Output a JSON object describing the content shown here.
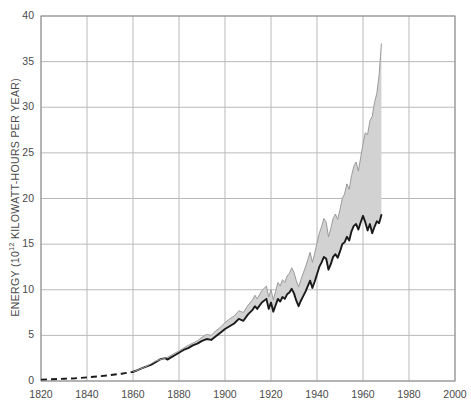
{
  "chart_data": {
    "type": "area",
    "title": "",
    "xlabel": "",
    "ylabel": "ENERGY (10¹² KILOWATT-HOURS PER YEAR)",
    "ylabel_prefix": "ENERGY (10",
    "ylabel_exponent": "12",
    "ylabel_suffix": " KILOWATT-HOURS PER YEAR)",
    "xlim": [
      1820,
      2000
    ],
    "ylim": [
      0,
      40
    ],
    "xticks": [
      1820,
      1840,
      1860,
      1880,
      1900,
      1920,
      1940,
      1960,
      1980,
      2000
    ],
    "yticks": [
      0,
      5,
      10,
      15,
      20,
      25,
      30,
      35,
      40
    ],
    "xtick_labels": [
      "1820",
      "1840",
      "1860",
      "1880",
      "1900",
      "1920",
      "1940",
      "1960",
      "1980",
      "2000"
    ],
    "ytick_labels": [
      "0",
      "5",
      "10",
      "15",
      "20",
      "25",
      "30",
      "35",
      "40"
    ],
    "grid": true,
    "legend": "none",
    "colors": {
      "band_fill": "#d2d2d2",
      "line": "#1a1a1a",
      "grid": "#b9b9b9",
      "axis": "#8c8c8c",
      "text": "#4a4a4a",
      "background": "#ffffff"
    },
    "series": [
      {
        "name": "lower-bound-energy",
        "style": "solid-line-with-dashed-extrapolation",
        "dashed_until_year": 1860,
        "x": [
          1820,
          1825,
          1830,
          1835,
          1840,
          1845,
          1850,
          1855,
          1860,
          1862,
          1864,
          1866,
          1868,
          1870,
          1872,
          1874,
          1875,
          1876,
          1878,
          1880,
          1882,
          1884,
          1886,
          1888,
          1890,
          1892,
          1894,
          1896,
          1898,
          1900,
          1902,
          1904,
          1906,
          1908,
          1910,
          1912,
          1913,
          1914,
          1916,
          1918,
          1919,
          1920,
          1921,
          1922,
          1923,
          1924,
          1925,
          1926,
          1927,
          1928,
          1929,
          1930,
          1931,
          1932,
          1933,
          1934,
          1935,
          1936,
          1937,
          1938,
          1939,
          1940,
          1941,
          1942,
          1943,
          1944,
          1945,
          1946,
          1947,
          1948,
          1949,
          1950,
          1951,
          1952,
          1953,
          1954,
          1955,
          1956,
          1957,
          1958,
          1959,
          1960,
          1961,
          1962,
          1963,
          1964,
          1965,
          1966,
          1967,
          1968
        ],
        "y": [
          0.15,
          0.2,
          0.25,
          0.3,
          0.4,
          0.5,
          0.65,
          0.8,
          1.0,
          1.2,
          1.4,
          1.6,
          1.8,
          2.1,
          2.4,
          2.5,
          2.35,
          2.5,
          2.8,
          3.1,
          3.4,
          3.6,
          3.9,
          4.1,
          4.4,
          4.6,
          4.5,
          4.9,
          5.3,
          5.7,
          6.0,
          6.3,
          6.8,
          6.6,
          7.3,
          7.8,
          8.2,
          7.9,
          8.6,
          9.0,
          7.9,
          8.6,
          7.6,
          8.3,
          9.0,
          8.7,
          9.2,
          9.0,
          9.5,
          9.7,
          10.1,
          9.6,
          8.8,
          8.2,
          8.8,
          9.3,
          9.8,
          10.4,
          11.0,
          10.2,
          10.9,
          11.7,
          12.5,
          13.0,
          13.6,
          13.4,
          12.2,
          12.8,
          13.6,
          13.9,
          13.5,
          14.2,
          15.0,
          15.2,
          15.8,
          15.4,
          16.4,
          17.0,
          17.2,
          16.6,
          17.4,
          18.1,
          17.4,
          16.5,
          17.2,
          16.2,
          16.9,
          17.5,
          17.3,
          18.2
        ]
      },
      {
        "name": "upper-bound-energy",
        "style": "band-upper-edge",
        "x": [
          1860,
          1865,
          1870,
          1875,
          1880,
          1884,
          1888,
          1890,
          1892,
          1894,
          1896,
          1898,
          1900,
          1902,
          1904,
          1906,
          1908,
          1910,
          1912,
          1913,
          1914,
          1916,
          1918,
          1919,
          1920,
          1921,
          1922,
          1923,
          1924,
          1925,
          1926,
          1927,
          1928,
          1929,
          1930,
          1931,
          1932,
          1933,
          1934,
          1935,
          1936,
          1937,
          1938,
          1939,
          1940,
          1941,
          1942,
          1943,
          1944,
          1945,
          1946,
          1947,
          1948,
          1949,
          1950,
          1951,
          1952,
          1953,
          1954,
          1955,
          1956,
          1957,
          1958,
          1959,
          1960,
          1961,
          1962,
          1963,
          1964,
          1965,
          1966,
          1967,
          1968
        ],
        "y": [
          1.0,
          1.5,
          2.2,
          2.6,
          3.3,
          3.9,
          4.4,
          4.8,
          5.1,
          5.0,
          5.5,
          5.9,
          6.4,
          6.8,
          7.1,
          7.7,
          7.5,
          8.3,
          8.9,
          9.4,
          9.0,
          9.9,
          10.4,
          9.2,
          10.0,
          8.9,
          9.8,
          10.8,
          10.4,
          11.1,
          10.8,
          11.5,
          11.8,
          12.4,
          11.9,
          11.0,
          10.3,
          11.1,
          11.8,
          12.5,
          13.3,
          14.1,
          13.0,
          14.0,
          15.1,
          16.2,
          16.9,
          17.8,
          17.4,
          15.8,
          16.7,
          17.8,
          18.3,
          17.7,
          18.8,
          20.0,
          20.5,
          21.6,
          21.0,
          22.5,
          23.5,
          24.0,
          23.0,
          24.5,
          26.0,
          27.2,
          27.0,
          28.5,
          29.0,
          30.5,
          31.5,
          33.5,
          37.0
        ]
      }
    ],
    "annotations": [
      {
        "text": "dashed segment 1820-1860 indicates estimated/extrapolated data"
      },
      {
        "text": "shaded grey band spans range between lower and upper energy estimates"
      }
    ]
  }
}
